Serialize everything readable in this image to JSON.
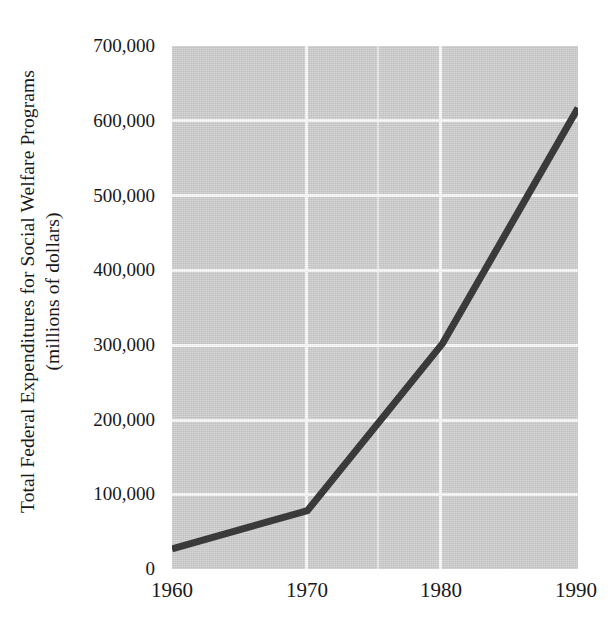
{
  "chart_data": {
    "type": "line",
    "title": "",
    "subtitle": "",
    "xlabel": "",
    "ylabel_line1": "Total Federal Expenditures for Social Welfare Programs",
    "ylabel_line2": "(millions of dollars)",
    "x": [
      1960,
      1970,
      1980,
      1990
    ],
    "xtick_labels": [
      "1960",
      "1970",
      "1980",
      "1990"
    ],
    "series": [
      {
        "name": "Total Federal Expenditures for Social Welfare Programs",
        "values": [
          27000,
          78000,
          302000,
          617000
        ]
      }
    ],
    "ytick_values": [
      0,
      100000,
      200000,
      300000,
      400000,
      500000,
      600000,
      700000
    ],
    "ytick_labels": [
      "0",
      "100,000",
      "200,000",
      "300,000",
      "400,000",
      "500,000",
      "600,000",
      "700,000"
    ],
    "xlim": [
      1960,
      1990
    ],
    "ylim": [
      0,
      700000
    ],
    "grid": true,
    "legend": false,
    "legend_position": "none",
    "colors": {
      "plot_background": "#cacaca",
      "gridline": "#f7f7f7",
      "series_line": "#3a3a3a",
      "text": "#18181a",
      "page_background": "#ffffff"
    },
    "annotations": []
  },
  "axis": {
    "y_title_lines": [
      "Total Federal Expenditures for Social Welfare Programs",
      "(millions of dollars)"
    ],
    "y_tick_labels": [
      "700,000",
      "600,000",
      "500,000",
      "400,000",
      "300,000",
      "200,000",
      "100,000",
      "0"
    ],
    "x_tick_labels": [
      "1960",
      "1970",
      "1980",
      "1990"
    ]
  }
}
